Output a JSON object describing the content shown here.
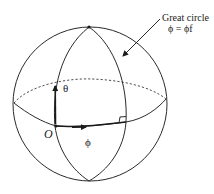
{
  "figure": {
    "labels": {
      "great_circle_title": "Great circle",
      "great_circle_equation": "ϕ = ϕf",
      "theta": "θ",
      "phi": "ϕ",
      "origin": "O"
    },
    "elements": [
      "sphere-outline",
      "equator-front (solid)",
      "equator-back (dashed)",
      "left meridian (through O)",
      "right meridian / great circle ϕ = ϕf",
      "theta arrow along meridian",
      "phi arrow along equator",
      "right-angle marker at meridian/equator intersection",
      "leader arrow from label to great circle",
      "poles marked with dots"
    ],
    "colors": {
      "line": "#2a2a2a",
      "background": "#ffffff"
    }
  }
}
